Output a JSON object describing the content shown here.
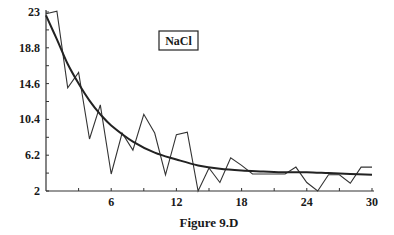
{
  "figure": {
    "caption": "Figure 9.D",
    "label_box": "NaCl"
  },
  "chart_data": {
    "type": "line",
    "title": "NaCl",
    "caption": "Figure 9.D",
    "xlabel": "",
    "ylabel": "",
    "xlim": [
      0,
      30
    ],
    "ylim": [
      2,
      23
    ],
    "x_ticks": [
      6,
      12,
      18,
      24,
      30
    ],
    "x_tick_labels": [
      "6",
      "12",
      "18",
      "24",
      "30"
    ],
    "y_ticks": [
      2,
      6.2,
      10.4,
      14.6,
      18.8,
      23
    ],
    "y_tick_labels": [
      "2",
      "6.2",
      "10.4",
      "14.6",
      "18.8",
      "23"
    ],
    "grid": false,
    "legend": {
      "entries": [
        "NaCl"
      ],
      "position": "upper center (boxed label)"
    },
    "series": [
      {
        "name": "observed",
        "style": "thin jagged line",
        "x": [
          0,
          1,
          2,
          3,
          4,
          5,
          6,
          7,
          8,
          9,
          10,
          11,
          12,
          13,
          14,
          15,
          16,
          17,
          18,
          19,
          20,
          21,
          22,
          23,
          24,
          25,
          26,
          27,
          28,
          29,
          30
        ],
        "values": [
          22.8,
          23.1,
          14.1,
          15.9,
          8.1,
          12.1,
          4.0,
          8.8,
          6.8,
          11.0,
          8.8,
          3.9,
          8.6,
          8.9,
          2.0,
          4.7,
          3.0,
          5.9,
          5.0,
          4.0,
          4.0,
          4.0,
          4.0,
          4.8,
          3.0,
          2.0,
          3.9,
          3.9,
          2.9,
          4.8,
          4.8
        ]
      },
      {
        "name": "fitted exponential decay",
        "style": "thick smooth curve",
        "x": [
          0,
          1,
          2,
          3,
          4,
          5,
          6,
          8,
          10,
          12,
          14,
          16,
          18,
          20,
          22,
          24,
          26,
          28,
          30
        ],
        "values": [
          22.6,
          19.8,
          16.9,
          14.6,
          12.6,
          11.0,
          9.7,
          7.8,
          6.5,
          5.7,
          5.0,
          4.6,
          4.4,
          4.3,
          4.2,
          4.2,
          4.1,
          4.0,
          3.9
        ]
      }
    ]
  }
}
